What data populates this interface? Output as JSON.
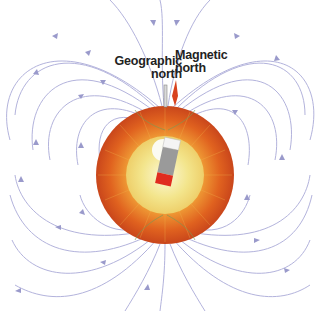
{
  "diagram": {
    "labels": {
      "geographic_north": [
        "Geographic",
        "north"
      ],
      "magnetic_north": [
        "Magnetic",
        "north"
      ]
    },
    "colors": {
      "field_line": "#a9a9d6",
      "mantle": "#d9531e",
      "outer_core": "#f2d36a",
      "inner_core": "#f7f4c2",
      "magnet_gray": "#8f8f8f",
      "magnet_red": "#e02b1f",
      "magnetic_pole_marker": "#d8421f"
    }
  }
}
